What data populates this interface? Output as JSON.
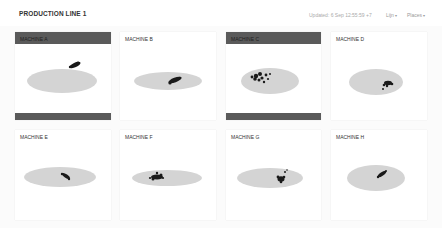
{
  "header": {
    "title": "PRODUCTION LINE 1",
    "updated": "Updated: 6 Sep 12:55:59 +7",
    "menus": [
      {
        "label": "Lijn",
        "icon": "caret-down-icon"
      },
      {
        "label": "Places",
        "icon": "caret-down-icon"
      }
    ]
  },
  "colors": {
    "alarm_header": "#5a5a5a",
    "ellipse_fill": "#d4d4d4",
    "points": "#1a1a1a",
    "card_bg": "#ffffff"
  },
  "machines": [
    {
      "name": "MACHINE A",
      "alarm": true
    },
    {
      "name": "MACHINE B",
      "alarm": false
    },
    {
      "name": "MACHINE C",
      "alarm": true
    },
    {
      "name": "MACHINE D",
      "alarm": false
    },
    {
      "name": "MACHINE E",
      "alarm": false
    },
    {
      "name": "MACHINE F",
      "alarm": false
    },
    {
      "name": "MACHINE G",
      "alarm": false
    },
    {
      "name": "MACHINE H",
      "alarm": false
    }
  ]
}
